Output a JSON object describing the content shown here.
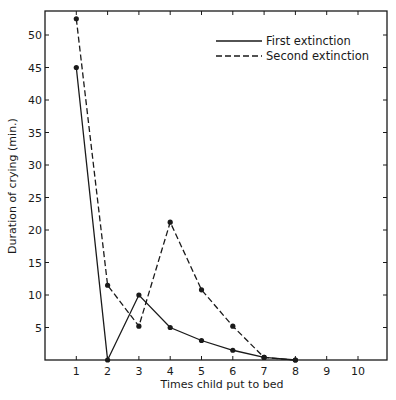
{
  "chart_data": {
    "type": "line",
    "title": "",
    "xlabel": "Times child put to bed",
    "ylabel": "Duration of crying (min.)",
    "x": [
      1,
      2,
      3,
      4,
      5,
      6,
      7,
      8,
      9,
      10
    ],
    "xticks": [
      "1",
      "2",
      "3",
      "4",
      "5",
      "6",
      "7",
      "8",
      "9",
      "10"
    ],
    "yticks": [
      "5",
      "10",
      "15",
      "20",
      "25",
      "30",
      "35",
      "40",
      "45",
      "50"
    ],
    "xlim": [
      0,
      11
    ],
    "ylim": [
      0,
      55
    ],
    "grid": false,
    "legend_position": "upper right",
    "series": [
      {
        "name": "First extinction",
        "style": "solid",
        "x": [
          1,
          2,
          3,
          4,
          5,
          6,
          7,
          8
        ],
        "values": [
          45,
          0,
          10,
          5,
          3,
          1.5,
          0.4,
          0
        ]
      },
      {
        "name": "Second extinction",
        "style": "dashed",
        "x": [
          1,
          2,
          3,
          4,
          5,
          6,
          7,
          8
        ],
        "values": [
          52.5,
          11.5,
          5.2,
          21.2,
          10.8,
          5.2,
          0.4,
          0
        ]
      }
    ]
  }
}
